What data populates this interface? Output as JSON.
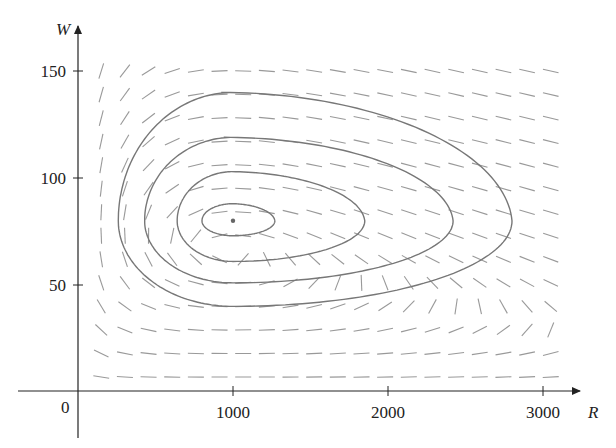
{
  "chart_data": {
    "type": "line",
    "subtype": "direction-field-phase-portrait",
    "title": "",
    "xlabel": "R",
    "ylabel": "W",
    "xlim": [
      -100,
      3200
    ],
    "ylim": [
      -20,
      160
    ],
    "x_ticks": [
      1000,
      2000,
      3000
    ],
    "x_tick_labels": [
      "1000",
      "2000",
      "3000"
    ],
    "y_ticks": [
      50,
      100,
      150
    ],
    "y_tick_labels": [
      "50",
      "100",
      "150"
    ],
    "origin_label": "0",
    "grid": false,
    "legend": null,
    "equilibrium_point": {
      "R": 1000,
      "W": 80
    },
    "direction_field": {
      "R_range": [
        150,
        3050
      ],
      "W_range": [
        7,
        150
      ],
      "columns": 20,
      "rows": 14,
      "style": "short gray dashes"
    },
    "series": [
      {
        "name": "orbit-1",
        "R_range": [
          800,
          1270
        ],
        "W_range": [
          73,
          88
        ]
      },
      {
        "name": "orbit-2",
        "R_range": [
          640,
          1850
        ],
        "W_range": [
          61,
          103
        ]
      },
      {
        "name": "orbit-3",
        "R_range": [
          430,
          2420
        ],
        "W_range": [
          51,
          119
        ]
      },
      {
        "name": "orbit-4",
        "R_range": [
          260,
          2800
        ],
        "W_range": [
          40,
          140
        ]
      }
    ]
  },
  "colors": {
    "axis": "#222222",
    "curve": "#777777",
    "field": "#999999"
  }
}
